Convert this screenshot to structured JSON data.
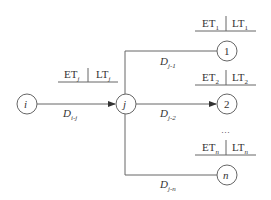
{
  "diagram": {
    "type": "network-node-diagram",
    "nodes": [
      {
        "id": "i",
        "label": "i"
      },
      {
        "id": "j",
        "label": "j",
        "et": "ET",
        "et_sub": "j",
        "lt": "LT",
        "lt_sub": "j"
      },
      {
        "id": "1",
        "label": "1",
        "et": "ET",
        "et_sub": "1",
        "lt": "LT",
        "lt_sub": "1"
      },
      {
        "id": "2",
        "label": "2",
        "et": "ET",
        "et_sub": "2",
        "lt": "LT",
        "lt_sub": "2"
      },
      {
        "id": "n",
        "label": "n",
        "et": "ET",
        "et_sub": "n",
        "lt": "LT",
        "lt_sub": "n"
      }
    ],
    "edges": [
      {
        "from": "i",
        "to": "j",
        "label": "D",
        "sub": "i-j"
      },
      {
        "from": "j",
        "to": "1",
        "label": "D",
        "sub": "j-1"
      },
      {
        "from": "j",
        "to": "2",
        "label": "D",
        "sub": "j-2"
      },
      {
        "from": "j",
        "to": "n",
        "label": "D",
        "sub": "j-n"
      }
    ],
    "ellipsis": "…",
    "line_color": "#666666"
  }
}
